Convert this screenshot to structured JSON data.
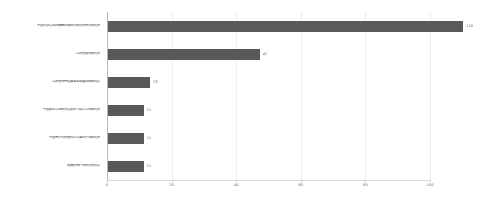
{
  "chart_data": {
    "type": "bar",
    "orientation": "horizontal",
    "title": "",
    "subtitle": "",
    "xlabel": "",
    "ylabel": "",
    "xlim": [
      0,
      112
    ],
    "grid": true,
    "legend": false,
    "legend_position": "none",
    "bar_color": "#595959",
    "axis_color": "#b8b8b8",
    "grid_color": "#ededed",
    "label_color": "#3c3c3c",
    "value_label_color": "#5a5a5a",
    "xticks": [
      "0",
      "20",
      "40",
      "60",
      "80",
      "100"
    ],
    "xtick_values": [
      0,
      20,
      40,
      60,
      80,
      100
    ],
    "categories": [
      "中国科学院西光精密机械技术研究所技术研究所",
      "江苏省激光研究所",
      "江苏省特种设备安全监督检验研究院",
      "中国航空工业研究院航空气动力工业研究所",
      "中国电子科技集团公司第四十五研究所",
      "南通光电产业技术研究院"
    ],
    "values": [
      110,
      47,
      13,
      11,
      11,
      11
    ],
    "value_labels": [
      "110",
      "47",
      "13",
      "11",
      "11",
      "11"
    ]
  }
}
